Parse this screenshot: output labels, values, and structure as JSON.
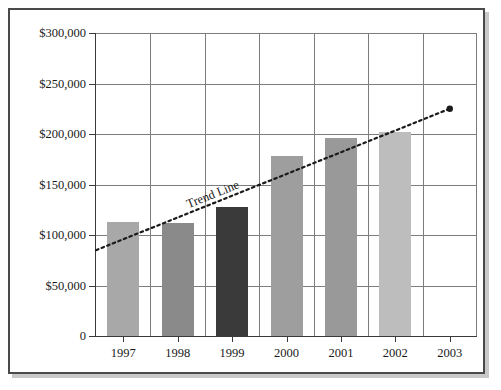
{
  "chart_data": {
    "type": "bar",
    "title": "",
    "subtitle": "",
    "xlabel": "",
    "ylabel": "",
    "categories": [
      "1997",
      "1998",
      "1999",
      "2000",
      "2001",
      "2002",
      "2003"
    ],
    "values": [
      113000,
      112000,
      128000,
      178000,
      196000,
      202000,
      null
    ],
    "ylim": [
      0,
      300000
    ],
    "ytick_labels": [
      "$300,000",
      "$250,000",
      "$200,000",
      "$150,000",
      "$100,000",
      "$50,000",
      "0"
    ],
    "ytick_values": [
      300000,
      250000,
      200000,
      150000,
      100000,
      50000,
      0
    ],
    "grid": true,
    "legend": "none",
    "bar_colors": [
      "#a8a8a8",
      "#8a8a8a",
      "#3a3a3a",
      "#9e9e9e",
      "#999999",
      "#bdbdbd",
      null
    ],
    "annotations": [
      {
        "name": "trend-line",
        "label": "Trend Line",
        "style": "dotted",
        "color": "#1a1a1a",
        "start": {
          "x": "1997",
          "y": 85000
        },
        "end": {
          "x": "2003",
          "y": 225000
        },
        "end_marker": "dot"
      }
    ]
  },
  "figure": {
    "frame_color": "#4a4a4a",
    "grid_color": "#7c7c7c",
    "axis_color": "#3a3a3a",
    "background": "#ffffff"
  }
}
